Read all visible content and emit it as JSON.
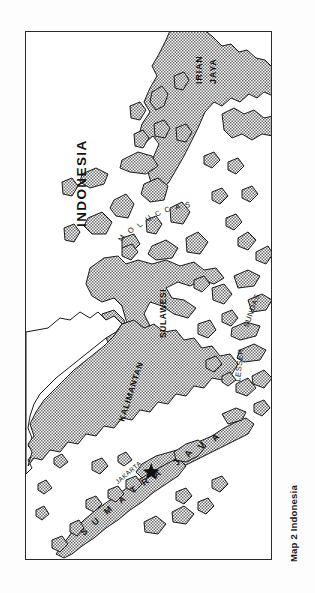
{
  "page": {
    "background_color": "#fdfdfd",
    "caption": "Map 2 Indonesia"
  },
  "map": {
    "title": "INDONESIA",
    "frame": {
      "border_color": "#2a2a2a",
      "fill_color": "#ffffff"
    },
    "land": {
      "shaded_fill_color": "#9a9a9a",
      "outline_color": "#1a1a1a",
      "unshaded_fill_color": "#ffffff"
    },
    "orientation_note": "map rotated 90 degrees on the page",
    "labels": [
      {
        "id": "irian-jaya",
        "text": "IRIAN JAYA",
        "lines": [
          "IRIAN",
          "JAYA"
        ]
      },
      {
        "id": "moluccas",
        "text": "MOLUCCAS"
      },
      {
        "id": "sulawesi",
        "text": "SULAWESI"
      },
      {
        "id": "kalimantan",
        "text": "KALIMANTAN"
      },
      {
        "id": "lesser-sundas",
        "text": "LESSER SUNDAS"
      },
      {
        "id": "java",
        "text": "JAVA"
      },
      {
        "id": "sumatra",
        "text": "SUMATRA"
      },
      {
        "id": "jakarta",
        "text": "JAKARTA"
      }
    ],
    "cities": [
      {
        "id": "jakarta",
        "name": "JAKARTA",
        "marker": "star"
      }
    ]
  }
}
